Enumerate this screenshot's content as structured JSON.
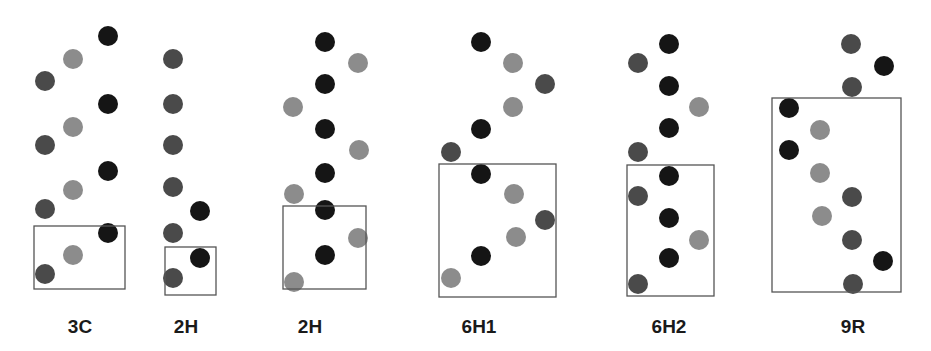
{
  "colors": {
    "black": "#151515",
    "mid": "#4a4a4a",
    "light": "#8c8c8c",
    "box": "#555555"
  },
  "dot_radius": 10,
  "panels": [
    {
      "label": "3C",
      "label_x": 80,
      "box": [
        34,
        226,
        91,
        63
      ],
      "dots": [
        [
          108,
          36,
          "black"
        ],
        [
          73,
          59,
          "light"
        ],
        [
          45,
          81,
          "mid"
        ],
        [
          108,
          104,
          "black"
        ],
        [
          73,
          127,
          "light"
        ],
        [
          45,
          145,
          "mid"
        ],
        [
          108,
          171,
          "black"
        ],
        [
          73,
          190,
          "light"
        ],
        [
          45,
          209,
          "mid"
        ],
        [
          108,
          233,
          "black"
        ],
        [
          73,
          255,
          "light"
        ],
        [
          45,
          274,
          "mid"
        ]
      ]
    },
    {
      "label": "2H",
      "label_x": 186,
      "box": [
        165,
        247,
        51,
        48
      ],
      "dots": [
        [
          173,
          59,
          "mid"
        ],
        [
          173,
          104,
          "mid"
        ],
        [
          173,
          145,
          "mid"
        ],
        [
          173,
          187,
          "mid"
        ],
        [
          200,
          211,
          "black"
        ],
        [
          173,
          233,
          "mid"
        ],
        [
          200,
          258,
          "black"
        ],
        [
          173,
          278,
          "mid"
        ]
      ]
    },
    {
      "label": "2H",
      "label_x": 310,
      "box": [
        283,
        206,
        83,
        83
      ],
      "dots": [
        [
          325,
          42,
          "black"
        ],
        [
          358,
          63,
          "light"
        ],
        [
          325,
          84,
          "black"
        ],
        [
          293,
          107,
          "light"
        ],
        [
          325,
          129,
          "black"
        ],
        [
          359,
          150,
          "light"
        ],
        [
          325,
          173,
          "black"
        ],
        [
          294,
          194,
          "light"
        ],
        [
          325,
          210,
          "black"
        ],
        [
          358,
          238,
          "light"
        ],
        [
          325,
          255,
          "black"
        ],
        [
          294,
          282,
          "light"
        ]
      ]
    },
    {
      "label": "6H1",
      "label_x": 479,
      "box": [
        439,
        164,
        117,
        133
      ],
      "dots": [
        [
          481,
          42,
          "black"
        ],
        [
          513,
          63,
          "light"
        ],
        [
          545,
          84,
          "mid"
        ],
        [
          513,
          107,
          "light"
        ],
        [
          481,
          129,
          "black"
        ],
        [
          451,
          152,
          "mid"
        ],
        [
          481,
          174,
          "black"
        ],
        [
          514,
          194,
          "light"
        ],
        [
          545,
          220,
          "mid"
        ],
        [
          516,
          237,
          "light"
        ],
        [
          481,
          256,
          "black"
        ],
        [
          451,
          278,
          "light"
        ]
      ]
    },
    {
      "label": "6H2",
      "label_x": 669,
      "box": [
        627,
        165,
        87,
        131
      ],
      "dots": [
        [
          669,
          44,
          "black"
        ],
        [
          638,
          63,
          "mid"
        ],
        [
          669,
          86,
          "black"
        ],
        [
          699,
          107,
          "light"
        ],
        [
          669,
          128,
          "black"
        ],
        [
          638,
          152,
          "mid"
        ],
        [
          669,
          176,
          "black"
        ],
        [
          638,
          196,
          "mid"
        ],
        [
          669,
          218,
          "black"
        ],
        [
          699,
          240,
          "light"
        ],
        [
          669,
          258,
          "black"
        ],
        [
          638,
          284,
          "mid"
        ]
      ]
    },
    {
      "label": "9R",
      "label_x": 853,
      "box": [
        772,
        98,
        129,
        194
      ],
      "dots": [
        [
          851,
          44,
          "mid"
        ],
        [
          884,
          66,
          "black"
        ],
        [
          852,
          87,
          "mid"
        ],
        [
          789,
          108,
          "black"
        ],
        [
          820,
          130,
          "light"
        ],
        [
          789,
          150,
          "black"
        ],
        [
          820,
          173,
          "light"
        ],
        [
          852,
          197,
          "mid"
        ],
        [
          822,
          216,
          "light"
        ],
        [
          852,
          240,
          "mid"
        ],
        [
          883,
          261,
          "black"
        ],
        [
          853,
          284,
          "mid"
        ]
      ]
    }
  ]
}
